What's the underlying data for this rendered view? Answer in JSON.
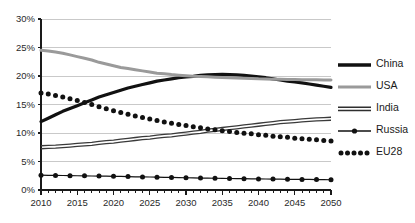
{
  "chart_data": {
    "type": "line",
    "title": "",
    "subtitle": "",
    "xlabel": "",
    "ylabel": "",
    "xlim": [
      2010,
      2050
    ],
    "ylim": [
      0,
      30
    ],
    "grid": "horizontal",
    "legend_position": "right",
    "x_tick_labels": [
      "2010",
      "2015",
      "2020",
      "2025",
      "2030",
      "2035",
      "2040",
      "2045",
      "2050"
    ],
    "x_tick_values": [
      2010,
      2015,
      2020,
      2025,
      2030,
      2035,
      2040,
      2045,
      2050
    ],
    "x_minor_tick_step": 1,
    "y_tick_labels": [
      "0%",
      "5%",
      "10%",
      "15%",
      "20%",
      "25%",
      "30%"
    ],
    "y_tick_values": [
      0,
      5,
      10,
      15,
      20,
      25,
      30
    ],
    "x": [
      2010,
      2011,
      2012,
      2013,
      2014,
      2015,
      2016,
      2017,
      2018,
      2019,
      2020,
      2021,
      2022,
      2023,
      2024,
      2025,
      2026,
      2027,
      2028,
      2029,
      2030,
      2031,
      2032,
      2033,
      2034,
      2035,
      2036,
      2037,
      2038,
      2039,
      2040,
      2041,
      2042,
      2043,
      2044,
      2045,
      2046,
      2047,
      2048,
      2049,
      2050
    ],
    "series": [
      {
        "name": "China",
        "style": "thick-black",
        "color": "#111111",
        "values": [
          12.0,
          12.6,
          13.2,
          13.8,
          14.3,
          14.8,
          15.3,
          15.8,
          16.3,
          16.7,
          17.1,
          17.5,
          17.9,
          18.2,
          18.5,
          18.8,
          19.1,
          19.3,
          19.5,
          19.7,
          19.85,
          19.95,
          20.1,
          20.2,
          20.25,
          20.3,
          20.25,
          20.2,
          20.1,
          20.0,
          19.85,
          19.7,
          19.5,
          19.3,
          19.1,
          18.95,
          18.8,
          18.6,
          18.4,
          18.2,
          18.0
        ]
      },
      {
        "name": "USA",
        "style": "thick-gray",
        "color": "#9a9a9a",
        "values": [
          24.5,
          24.4,
          24.2,
          24.0,
          23.7,
          23.4,
          23.1,
          22.8,
          22.4,
          22.1,
          21.8,
          21.5,
          21.3,
          21.1,
          20.9,
          20.7,
          20.5,
          20.4,
          20.25,
          20.15,
          20.05,
          19.95,
          19.9,
          19.85,
          19.8,
          19.75,
          19.7,
          19.65,
          19.6,
          19.55,
          19.5,
          19.48,
          19.45,
          19.42,
          19.4,
          19.38,
          19.36,
          19.34,
          19.33,
          19.32,
          19.3
        ]
      },
      {
        "name": "India",
        "style": "double-line",
        "color": "#3a3a3a",
        "values": [
          7.5,
          7.55,
          7.6,
          7.7,
          7.8,
          7.9,
          8.0,
          8.1,
          8.25,
          8.4,
          8.5,
          8.65,
          8.8,
          8.95,
          9.1,
          9.2,
          9.35,
          9.5,
          9.6,
          9.75,
          9.9,
          10.05,
          10.2,
          10.4,
          10.55,
          10.7,
          10.85,
          11.0,
          11.15,
          11.3,
          11.45,
          11.6,
          11.75,
          11.9,
          12.0,
          12.1,
          12.2,
          12.3,
          12.4,
          12.45,
          12.5
        ]
      },
      {
        "name": "Russia",
        "style": "line-with-dots",
        "color": "#111111",
        "values": [
          2.6,
          2.58,
          2.56,
          2.54,
          2.52,
          2.5,
          2.48,
          2.46,
          2.44,
          2.42,
          2.4,
          2.38,
          2.35,
          2.32,
          2.3,
          2.28,
          2.25,
          2.22,
          2.2,
          2.18,
          2.15,
          2.12,
          2.1,
          2.08,
          2.06,
          2.04,
          2.02,
          2.0,
          1.98,
          1.96,
          1.95,
          1.93,
          1.91,
          1.9,
          1.88,
          1.87,
          1.86,
          1.85,
          1.83,
          1.82,
          1.8
        ]
      },
      {
        "name": "EU28",
        "style": "dotted",
        "color": "#111111",
        "values": [
          17.0,
          16.85,
          16.6,
          16.3,
          16.0,
          15.7,
          15.35,
          15.0,
          14.6,
          14.25,
          13.9,
          13.6,
          13.3,
          13.0,
          12.7,
          12.45,
          12.2,
          11.95,
          11.7,
          11.5,
          11.3,
          11.1,
          10.9,
          10.7,
          10.55,
          10.4,
          10.25,
          10.1,
          9.95,
          9.85,
          9.7,
          9.6,
          9.45,
          9.35,
          9.25,
          9.1,
          9.0,
          8.9,
          8.8,
          8.7,
          8.6
        ]
      }
    ]
  },
  "legend": {
    "items": [
      {
        "label": "China"
      },
      {
        "label": "USA"
      },
      {
        "label": "India"
      },
      {
        "label": "Russia"
      },
      {
        "label": "EU28"
      }
    ]
  },
  "colors": {
    "china": "#111111",
    "usa": "#9a9a9a",
    "india": "#3a3a3a",
    "russia": "#111111",
    "eu28": "#111111",
    "gridline": "#c9c9c9",
    "axis": "#1a1a1a",
    "background": "#ffffff"
  }
}
